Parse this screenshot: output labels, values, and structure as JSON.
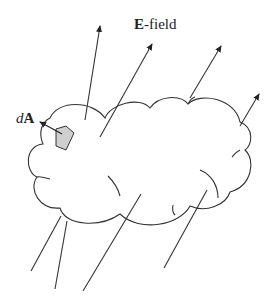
{
  "diagram": {
    "labels": {
      "field_bold": "E",
      "field_rest": "-field",
      "area_italic": "d",
      "area_bold": "A"
    },
    "colors": {
      "stroke": "#333333",
      "patch_fill": "#cfcfcf",
      "background": "#ffffff"
    },
    "elements": [
      "closed cloud-shaped surface",
      "shaded surface element dA with outward normal arrow",
      "electric field lines passing through surface (4 exiting with arrows, 4 entering from below)"
    ]
  }
}
